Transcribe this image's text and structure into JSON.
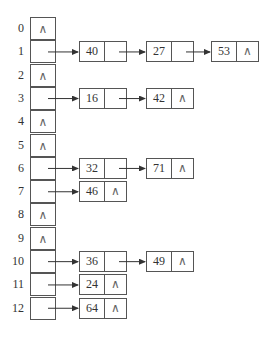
{
  "diagram": {
    "type": "hash-table-chaining",
    "null_symbol": "∧",
    "slots": [
      {
        "index": "0",
        "chain": []
      },
      {
        "index": "1",
        "chain": [
          "40",
          "27",
          "53"
        ]
      },
      {
        "index": "2",
        "chain": []
      },
      {
        "index": "3",
        "chain": [
          "16",
          "42"
        ]
      },
      {
        "index": "4",
        "chain": []
      },
      {
        "index": "5",
        "chain": []
      },
      {
        "index": "6",
        "chain": [
          "32",
          "71"
        ]
      },
      {
        "index": "7",
        "chain": [
          "46"
        ]
      },
      {
        "index": "8",
        "chain": []
      },
      {
        "index": "9",
        "chain": []
      },
      {
        "index": "10",
        "chain": [
          "36",
          "49"
        ]
      },
      {
        "index": "11",
        "chain": [
          "24"
        ]
      },
      {
        "index": "12",
        "chain": [
          "64"
        ]
      }
    ]
  }
}
